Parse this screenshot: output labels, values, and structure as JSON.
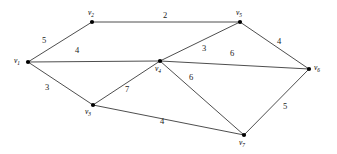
{
  "figure": {
    "type": "weighted-undirected-graph",
    "width": 337,
    "height": 154,
    "background_color": "#ffffff",
    "edge_color": "#3a3a3a",
    "node_color": "#000000"
  },
  "chart_data": {
    "type": "diagram",
    "title": "",
    "graph_kind": "weighted undirected graph",
    "node_count": 7,
    "edge_count": 11,
    "nodes": [
      {
        "id": "v1",
        "label": "v",
        "subscript": "1",
        "x": 28,
        "y": 62,
        "label_x": 14,
        "label_y": 57
      },
      {
        "id": "v2",
        "label": "v",
        "subscript": "2",
        "x": 92,
        "y": 22,
        "label_x": 88,
        "label_y": 9
      },
      {
        "id": "v3",
        "label": "v",
        "subscript": "3",
        "x": 93,
        "y": 105,
        "label_x": 85,
        "label_y": 108
      },
      {
        "id": "v4",
        "label": "v",
        "subscript": "4",
        "x": 160,
        "y": 61,
        "label_x": 155,
        "label_y": 65
      },
      {
        "id": "v5",
        "label": "v",
        "subscript": "5",
        "x": 240,
        "y": 22,
        "label_x": 236,
        "label_y": 9
      },
      {
        "id": "v6",
        "label": "v",
        "subscript": "6",
        "x": 309,
        "y": 69,
        "label_x": 314,
        "label_y": 64
      },
      {
        "id": "v7",
        "label": "v",
        "subscript": "7",
        "x": 244,
        "y": 135,
        "label_x": 239,
        "label_y": 139
      }
    ],
    "edges": [
      {
        "id": "e-v1-v2",
        "source": "v1",
        "target": "v2",
        "weight": "5",
        "label_x": 42,
        "label_y": 36
      },
      {
        "id": "e-v2-v5",
        "source": "v2",
        "target": "v5",
        "weight": "2",
        "label_x": 163,
        "label_y": 11
      },
      {
        "id": "e-v1-v4",
        "source": "v1",
        "target": "v4",
        "weight": "4",
        "label_x": 75,
        "label_y": 46
      },
      {
        "id": "e-v1-v3",
        "source": "v1",
        "target": "v3",
        "weight": "3",
        "label_x": 45,
        "label_y": 83
      },
      {
        "id": "e-v4-v5",
        "source": "v4",
        "target": "v5",
        "weight": "3",
        "label_x": 202,
        "label_y": 44
      },
      {
        "id": "e-v5-v6",
        "source": "v5",
        "target": "v6",
        "weight": "4",
        "label_x": 277,
        "label_y": 37
      },
      {
        "id": "e-v4-v6",
        "source": "v4",
        "target": "v6",
        "weight": "6",
        "label_x": 230,
        "label_y": 49
      },
      {
        "id": "e-v3-v4",
        "source": "v3",
        "target": "v4",
        "weight": "7",
        "label_x": 125,
        "label_y": 85
      },
      {
        "id": "e-v4-v7",
        "source": "v4",
        "target": "v7",
        "weight": "6",
        "label_x": 189,
        "label_y": 73
      },
      {
        "id": "e-v3-v7",
        "source": "v3",
        "target": "v7",
        "weight": "4",
        "label_x": 160,
        "label_y": 117
      },
      {
        "id": "e-v6-v7",
        "source": "v6",
        "target": "v7",
        "weight": "5",
        "label_x": 283,
        "label_y": 102
      }
    ]
  }
}
